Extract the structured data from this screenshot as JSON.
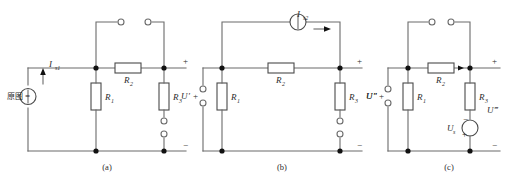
{
  "figure": {
    "background_color": "#ffffff",
    "wire_color": "#6b6b6b",
    "node_color": "#111111",
    "text_color": "#2b2b2b"
  },
  "circuits": [
    {
      "id": "a",
      "caption": "(a)",
      "prefix_note": "原图 =",
      "source": {
        "kind": "current-source",
        "label": "I",
        "subscript": "s1",
        "arrow_direction": "up"
      },
      "resistors": [
        {
          "name": "R1",
          "label": "R",
          "subscript": "1",
          "orientation": "vertical"
        },
        {
          "name": "R2",
          "label": "R",
          "subscript": "2",
          "orientation": "horizontal"
        },
        {
          "name": "R3",
          "label": "R",
          "subscript": "3",
          "orientation": "vertical"
        }
      ],
      "port": {
        "plus": "+",
        "minus": "−",
        "voltage_label": "",
        "voltage_primes": ""
      },
      "open_terminals": {
        "top_switch": true,
        "right_branch_gap": true
      }
    },
    {
      "id": "b",
      "caption": "(b)",
      "source": {
        "kind": "current-source",
        "label": "I",
        "subscript": "s2",
        "arrow_direction": "right"
      },
      "resistors": [
        {
          "name": "R1",
          "label": "R",
          "subscript": "1",
          "orientation": "vertical"
        },
        {
          "name": "R2",
          "label": "R",
          "subscript": "2",
          "orientation": "horizontal"
        },
        {
          "name": "R3",
          "label": "R",
          "subscript": "3",
          "orientation": "vertical"
        }
      ],
      "left_port": {
        "voltage_label": "U",
        "primes": "′",
        "plus": "+",
        "minus": "−"
      },
      "right_port": {
        "voltage_label": "U",
        "primes": "″",
        "plus": "+",
        "minus": "−"
      },
      "open_terminals": {
        "left_port_gap": true,
        "right_branch_gap": true
      }
    },
    {
      "id": "c",
      "caption": "(c)",
      "source": {
        "kind": "voltage-source",
        "label": "U",
        "subscript": "s",
        "top_sign": "−",
        "bottom_sign": "+"
      },
      "resistors": [
        {
          "name": "R1",
          "label": "R",
          "subscript": "1",
          "orientation": "vertical"
        },
        {
          "name": "R2",
          "label": "R",
          "subscript": "2",
          "orientation": "horizontal"
        },
        {
          "name": "R3",
          "label": "R",
          "subscript": "3",
          "orientation": "vertical"
        }
      ],
      "left_port": {
        "voltage_label": "U",
        "primes": "″",
        "plus": "+",
        "minus": "−"
      },
      "right_port": {
        "voltage_label": "U",
        "primes": "‴",
        "plus": "+",
        "minus": "−"
      },
      "open_terminals": {
        "top_switch": true,
        "left_port_gap": true
      }
    }
  ],
  "captions": {
    "a": "(a)",
    "b": "(b)",
    "c": "(c)"
  },
  "signs": {
    "plus": "+",
    "minus": "−"
  },
  "labels": {
    "R": "R",
    "I": "I",
    "U": "U",
    "sub1": "1",
    "sub2": "2",
    "sub3": "3",
    "subs1": "s1",
    "subs2": "s2",
    "subs": "s",
    "prime1": "′",
    "prime2": "″",
    "prime3": "‴",
    "equals": "=",
    "cjk_note": "原图"
  }
}
